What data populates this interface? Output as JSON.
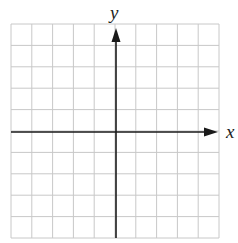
{
  "chart_data": {
    "type": "coordinate-grid",
    "title": "",
    "xlabel": "x",
    "ylabel": "y",
    "grid": true,
    "grid_columns": 10,
    "grid_rows": 10,
    "xlim": [
      -5,
      5
    ],
    "ylim": [
      -5,
      5
    ],
    "x_axis_arrow": "right",
    "y_axis_arrow": "up",
    "tick_labels": false,
    "series": []
  },
  "colors": {
    "grid_line": "#c8c8c8",
    "axis_line": "#1a1a1a",
    "background": "#ffffff"
  }
}
